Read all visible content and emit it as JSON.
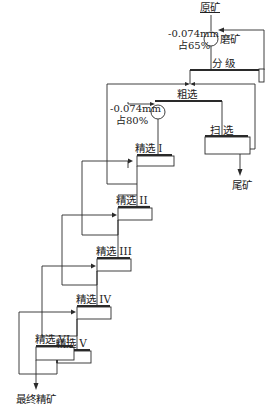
{
  "diagram": {
    "type": "flowsheet",
    "title": "",
    "nodes": {
      "feed": "原矿",
      "grinding": "磨矿",
      "grind1_spec_a": "-0.074mm",
      "grind1_spec_b": "占65%",
      "classification": "分  级",
      "rougher": "粗选",
      "regrind_spec_a": "-0.074mm",
      "regrind_spec_b": "占80%",
      "scavenger": "扫  选",
      "tailings": "尾矿",
      "cleaner1": "精选 I",
      "cleaner2": "精选 II",
      "cleaner3": "精选 III",
      "cleaner4": "精选 IV",
      "cleaner5": "精选 V",
      "cleaner6": "精选 VI",
      "final_concentrate": "最终精矿"
    },
    "colors": {
      "line": "#2a2a2a",
      "background": "#ffffff"
    }
  }
}
